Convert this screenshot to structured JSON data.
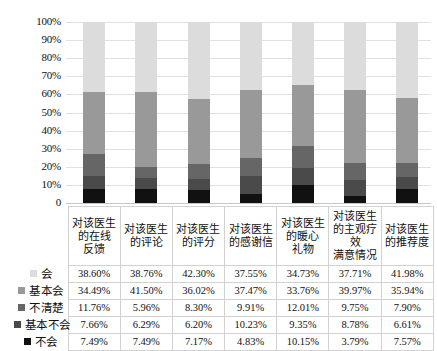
{
  "chart_data": {
    "type": "bar",
    "subtype": "stacked-percent-column",
    "title": "",
    "subtitle": "",
    "xlabel": "",
    "ylabel": "",
    "ylim": [
      0,
      100
    ],
    "grid": true,
    "legend_position": "table-left",
    "y_ticks": [
      "0",
      "10%",
      "20%",
      "30%",
      "40%",
      "50%",
      "60%",
      "70%",
      "80%",
      "90%",
      "100%"
    ],
    "y_tick_values": [
      0,
      10,
      20,
      30,
      40,
      50,
      60,
      70,
      80,
      90,
      100
    ],
    "categories": [
      "对该医生的在线反馈",
      "对该医生的评论",
      "对该医生的评分",
      "对该医生的感谢信",
      "对该医生的暖心礼物",
      "对该医生的主观疗效满意情况",
      "对该医生的推荐度"
    ],
    "category_lines": [
      [
        "对该医生",
        "的在线",
        "反馈"
      ],
      [
        "对该医生",
        "的评论"
      ],
      [
        "对该医生",
        "的评分"
      ],
      [
        "对该医生",
        "的感谢信"
      ],
      [
        "对该医生",
        "的暖心",
        "礼物"
      ],
      [
        "对该医生",
        "的主观疗效",
        "满意情况"
      ],
      [
        "对该医生",
        "的推荐度"
      ]
    ],
    "series": [
      {
        "name": "会",
        "color": "#dcdcdc",
        "values": [
          38.6,
          38.76,
          42.3,
          37.55,
          34.73,
          37.71,
          41.98
        ],
        "labels": [
          "38.60%",
          "38.76%",
          "42.30%",
          "37.55%",
          "34.73%",
          "37.71%",
          "41.98%"
        ]
      },
      {
        "name": "基本会",
        "color": "#999999",
        "values": [
          34.49,
          41.5,
          36.02,
          37.47,
          33.76,
          39.97,
          35.94
        ],
        "labels": [
          "34.49%",
          "41.50%",
          "36.02%",
          "37.47%",
          "33.76%",
          "39.97%",
          "35.94%"
        ]
      },
      {
        "name": "不清楚",
        "color": "#666666",
        "values": [
          11.76,
          5.96,
          8.3,
          9.91,
          12.01,
          9.75,
          7.9
        ],
        "labels": [
          "11.76%",
          "5.96%",
          "8.30%",
          "9.91%",
          "12.01%",
          "9.75%",
          "7.90%"
        ]
      },
      {
        "name": "基本不会",
        "color": "#4a4a4a",
        "values": [
          7.66,
          6.29,
          6.2,
          10.23,
          9.35,
          8.78,
          6.61
        ],
        "labels": [
          "7.66%",
          "6.29%",
          "6.20%",
          "10.23%",
          "9.35%",
          "8.78%",
          "6.61%"
        ]
      },
      {
        "name": "不会",
        "color": "#111111",
        "values": [
          7.49,
          7.49,
          7.17,
          4.83,
          10.15,
          3.79,
          7.57
        ],
        "labels": [
          "7.49%",
          "7.49%",
          "7.17%",
          "4.83%",
          "10.15%",
          "3.79%",
          "7.57%"
        ]
      }
    ],
    "stack_order_bottom_to_top": [
      "不会",
      "基本不会",
      "不清楚",
      "基本会",
      "会"
    ]
  }
}
